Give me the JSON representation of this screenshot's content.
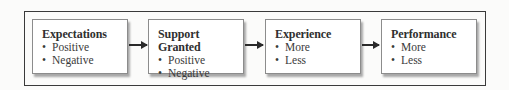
{
  "diagram": {
    "type": "flow",
    "boxes": [
      {
        "title": "Expectations",
        "items": [
          "Positive",
          "Negative"
        ]
      },
      {
        "title": "Support Granted",
        "items": [
          "Positive",
          "Negative"
        ]
      },
      {
        "title": "Experience",
        "items": [
          "More",
          "Less"
        ]
      },
      {
        "title": "Performance",
        "items": [
          "More",
          "Less"
        ]
      }
    ],
    "bullet": "•",
    "arrows": [
      {
        "from": "Expectations",
        "to": "Support Granted"
      },
      {
        "from": "Support Granted",
        "to": "Experience"
      },
      {
        "from": "Experience",
        "to": "Performance"
      }
    ]
  }
}
